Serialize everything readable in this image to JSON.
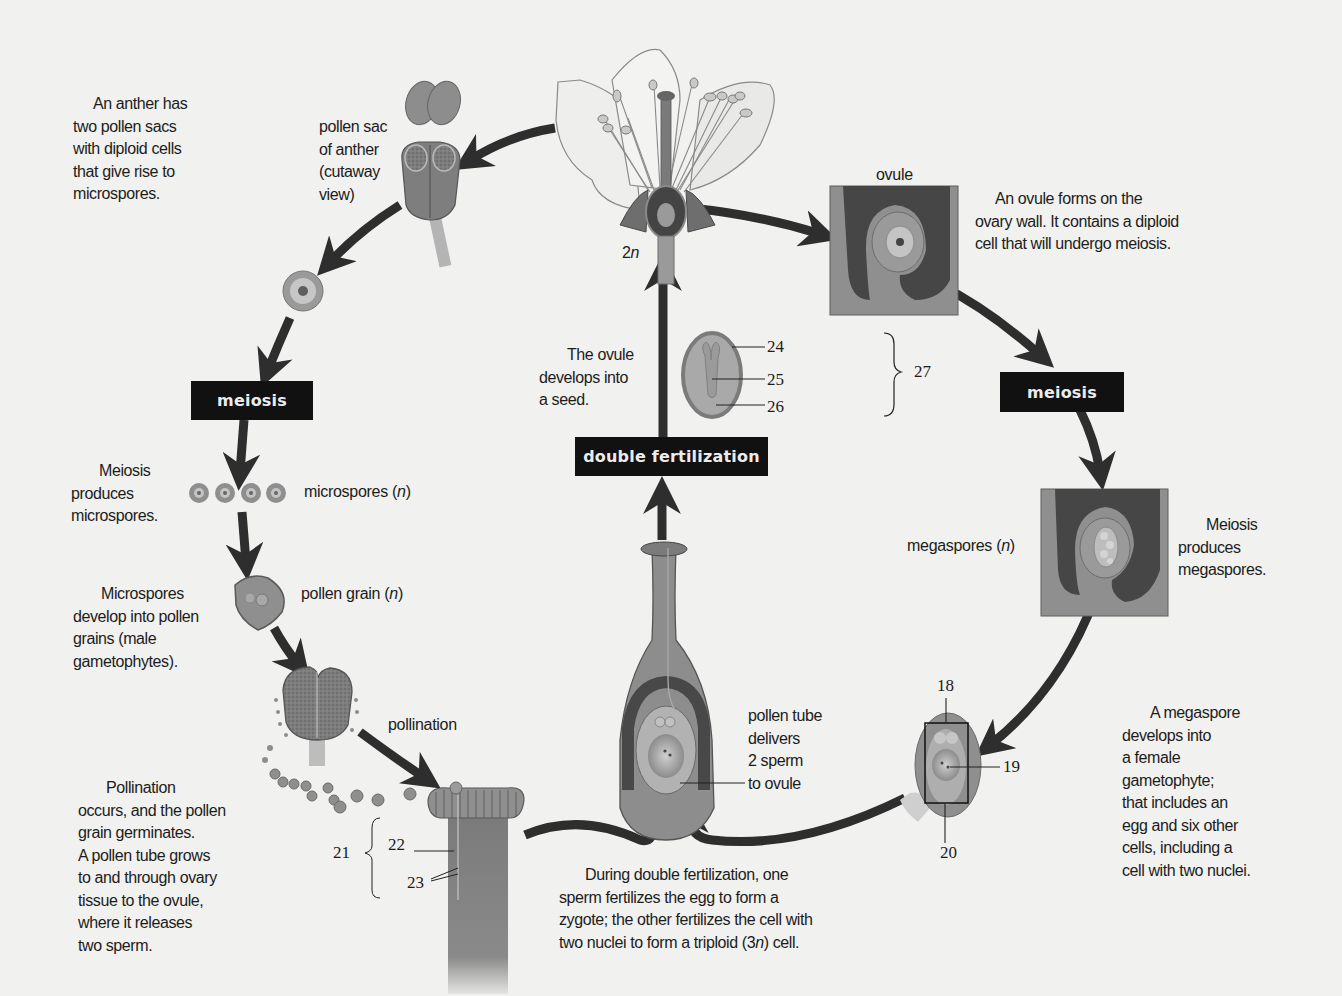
{
  "diagram": {
    "colors": {
      "background": "#f1f1ef",
      "arrow": "#2e2e2e",
      "label_box": "#111111",
      "label_box_text": "#ececec",
      "tissue_dark": "#4a4a4a",
      "tissue_mid": "#8a8a8a",
      "tissue_light": "#b8b8b8"
    },
    "process_boxes": {
      "meiosis_male": "meiosis",
      "meiosis_female": "meiosis",
      "double_fertilization": "double fertilization"
    },
    "structure_labels": {
      "pollen_sac": [
        "pollen sac",
        "of anther",
        "(cutaway",
        "view)"
      ],
      "flower_ploidy": "2n",
      "ovule": "ovule",
      "microspores": "microspores (n)",
      "pollen_grain": "pollen grain (n)",
      "pollination": "pollination",
      "megaspores": "megaspores (n)",
      "pollen_tube": [
        "pollen tube",
        "delivers",
        "2 sperm",
        "to ovule"
      ]
    },
    "captions": {
      "anther": [
        "An anther has",
        "two pollen sacs",
        "with diploid cells",
        "that give rise to",
        "microspores."
      ],
      "ovule_forms": [
        "An ovule forms on the",
        "ovary wall. It contains a diploid",
        "cell that will undergo meiosis."
      ],
      "seed": [
        "The ovule",
        "develops into",
        "a seed."
      ],
      "meiosis_micro": [
        "Meiosis",
        "produces",
        "microspores."
      ],
      "microspores_develop": [
        "Microspores",
        "develop into pollen",
        "grains (male",
        "gametophytes)."
      ],
      "meiosis_mega": [
        "Meiosis",
        "produces",
        "megaspores."
      ],
      "megaspore_develops": [
        "A megaspore",
        "develops into",
        "a female",
        "gametophyte;",
        "that includes an",
        "egg and six other",
        "cells, including a",
        "cell with two nuclei."
      ],
      "pollination": [
        "Pollination",
        "occurs, and the pollen",
        "grain germinates.",
        "A pollen tube grows",
        "to and through ovary",
        "tissue to the ovule,",
        "where it releases",
        "two sperm."
      ],
      "double_fertilization": [
        "During double fertilization, one",
        "sperm fertilizes the egg to form a",
        "zygote; the other fertilizes the cell with",
        "two nuclei to form a triploid (3n) cell."
      ]
    },
    "numbered_callouts": {
      "seed_parts": [
        "24",
        "25",
        "26"
      ],
      "seed_group": "27",
      "gametophyte_parts": [
        "18",
        "19",
        "20"
      ],
      "stigma_group": "21",
      "stigma_parts": [
        "22",
        "23"
      ]
    }
  }
}
